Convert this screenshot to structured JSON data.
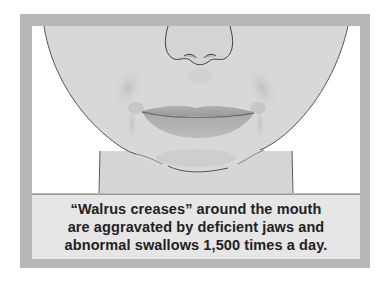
{
  "figure": {
    "colors": {
      "frame": "#b7b7b7",
      "background": "#ffffff",
      "skin": "#d8d8d8",
      "skin_shadow": "#c4c4c4",
      "lips": "#a9a9a9",
      "lip_line": "#7a7a7a",
      "outline": "#555555",
      "caption_bg": "#e6e6e6",
      "caption_text": "#222222"
    }
  },
  "caption": {
    "lines": [
      "“Walrus creases” around the mouth",
      "are aggravated by deficient jaws and",
      "abnormal swallows 1,500 times a day."
    ]
  }
}
